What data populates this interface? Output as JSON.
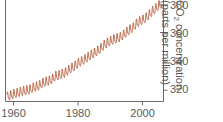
{
  "chart_data": {
    "type": "line",
    "title": "",
    "subtitle": "",
    "xlabel": "",
    "ylabel": "CO2 concentration (parts per million)",
    "ylabel_line1": "CO",
    "ylabel_line1_sub": "2",
    "ylabel_line1_rest": " concentration",
    "ylabel_line2": "(parts per million)",
    "xlim": [
      1957.5,
      2006.5
    ],
    "ylim": [
      312,
      384
    ],
    "grid": false,
    "legend": null,
    "y_axis_side": "right",
    "series_color": "#b0522f",
    "axis_color": "#6b6b6b",
    "tick_label_color": "#5a5a5a",
    "background": "#ffffff",
    "xticks": [
      1960,
      1980,
      2000
    ],
    "xtick_labels": [
      "1960",
      "1980",
      "2000"
    ],
    "yticks": [
      320,
      340,
      360,
      380
    ],
    "ytick_labels": [
      "320",
      "340",
      "360",
      "380"
    ],
    "annotation": "Seasonal oscillation of roughly 6 ppm superimposed on rising trend",
    "series": [
      {
        "name": "Mauna Loa monthly mean CO2",
        "description": "Annual mean trend with seasonal sawtooth",
        "x": [
          1958,
          1959,
          1960,
          1961,
          1962,
          1963,
          1964,
          1965,
          1966,
          1967,
          1968,
          1969,
          1970,
          1971,
          1972,
          1973,
          1974,
          1975,
          1976,
          1977,
          1978,
          1979,
          1980,
          1981,
          1982,
          1983,
          1984,
          1985,
          1986,
          1987,
          1988,
          1989,
          1990,
          1991,
          1992,
          1993,
          1994,
          1995,
          1996,
          1997,
          1998,
          1999,
          2000,
          2001,
          2002,
          2003,
          2004,
          2005,
          2006
        ],
        "values": [
          315.0,
          315.8,
          316.9,
          317.6,
          318.4,
          319.0,
          319.6,
          320.0,
          321.4,
          322.2,
          323.0,
          324.6,
          325.7,
          326.3,
          327.5,
          329.7,
          330.2,
          331.1,
          332.0,
          333.8,
          335.4,
          336.8,
          338.7,
          340.1,
          341.4,
          343.0,
          344.6,
          346.0,
          347.4,
          349.2,
          351.6,
          353.1,
          354.4,
          355.6,
          356.4,
          357.1,
          358.8,
          360.8,
          362.6,
          363.8,
          366.6,
          368.3,
          369.5,
          371.0,
          373.1,
          375.6,
          377.4,
          379.7,
          381.1
        ]
      }
    ],
    "seasonal_amplitude": 3.0,
    "samples_per_year": 12
  },
  "plot_geometry": {
    "left_spine_x": 5.5,
    "right_spine_x": 163.5,
    "top_y": 0,
    "bottom_spine_y": 101.5,
    "tick_len": 4
  }
}
